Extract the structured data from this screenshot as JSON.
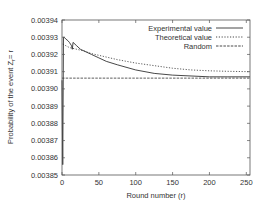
{
  "chart_data": {
    "type": "line",
    "title": "",
    "xlabel": "Round number (r)",
    "ylabel": "Probability of the event Z",
    "ylabel_sub": "r",
    "ylabel_suffix": "= r",
    "xlim": [
      0,
      255
    ],
    "ylim": [
      0.00385,
      0.00394
    ],
    "xticks": [
      0,
      50,
      100,
      150,
      200,
      250
    ],
    "yticks": [
      0.00385,
      0.00386,
      0.00387,
      0.00388,
      0.00389,
      0.0039,
      0.00391,
      0.00392,
      0.00393,
      0.00394
    ],
    "ytick_labels": [
      "0.00385",
      "0.00386",
      "0.00387",
      "0.00388",
      "0.00389",
      "0.00390",
      "0.00391",
      "0.00392",
      "0.00393",
      "0.00394"
    ],
    "xtick_labels": [
      "0",
      "50",
      "100",
      "150",
      "200",
      "250"
    ],
    "grid": false,
    "legend_position": "top-right",
    "series": [
      {
        "name": "Experimental value",
        "style": "solid",
        "x": [
          0,
          1,
          2,
          3,
          5,
          8,
          10,
          13,
          14,
          15,
          20,
          25,
          30,
          40,
          50,
          60,
          75,
          100,
          125,
          150,
          175,
          200,
          225,
          255
        ],
        "y": [
          0.003905,
          0.003856,
          0.00393,
          0.00393,
          0.003929,
          0.003928,
          0.003927,
          0.003925,
          0.003923,
          0.003927,
          0.003925,
          0.003923,
          0.003922,
          0.00392,
          0.003918,
          0.003916,
          0.003914,
          0.003911,
          0.003909,
          0.003908,
          0.0039075,
          0.003907,
          0.003907,
          0.003907
        ]
      },
      {
        "name": "Theoretical value",
        "style": "dotted",
        "x": [
          1,
          10,
          20,
          30,
          40,
          50,
          75,
          100,
          125,
          150,
          175,
          200,
          225,
          255
        ],
        "y": [
          0.003926,
          0.003924,
          0.003923,
          0.003922,
          0.0039205,
          0.0039195,
          0.003917,
          0.003915,
          0.0039135,
          0.003912,
          0.003911,
          0.0039105,
          0.0039102,
          0.00391
        ]
      },
      {
        "name": "Random",
        "style": "dashed",
        "x": [
          0,
          255
        ],
        "y": [
          0.00390625,
          0.00390625
        ]
      }
    ]
  }
}
